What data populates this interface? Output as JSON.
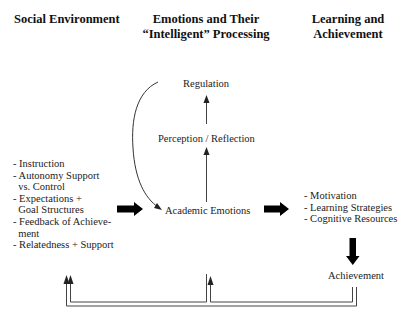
{
  "headers": {
    "social": "Social Environment",
    "emotions_line1": "Emotions and Their",
    "emotions_line2": "“Intelligent” Processing",
    "learning_line1": "Learning and",
    "learning_line2": "Achievement"
  },
  "nodes": {
    "regulation": "Regulation",
    "perception": "Perception / Reflection",
    "academic_emotions": "Academic Emotions",
    "achievement": "Achievement"
  },
  "social_factors": [
    "- Instruction",
    "- Autonomy Support",
    "  vs. Control",
    "- Expectations +",
    "  Goal Structures",
    "- Feedback of Achieve-",
    "  ment",
    "- Relatedness + Support"
  ],
  "learning_factors": [
    "- Motivation",
    "- Learning Strategies",
    "- Cognitive Resources"
  ],
  "colors": {
    "line": "#333333",
    "block_arrow": "#000000",
    "text": "#222222"
  }
}
